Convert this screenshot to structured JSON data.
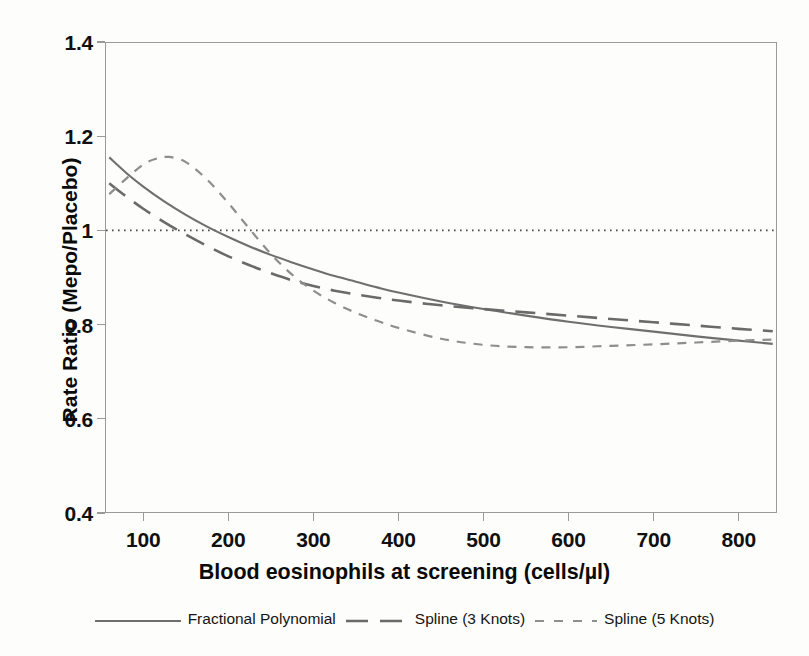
{
  "chart_data": {
    "type": "line",
    "title": "",
    "xlabel": "Blood eosinophils at screening (cells/µl)",
    "ylabel": "Rate Ratio (Mepo/Placebo)",
    "xlim": [
      55,
      845
    ],
    "ylim": [
      0.4,
      1.4
    ],
    "xticks": [
      100,
      200,
      300,
      400,
      500,
      600,
      700,
      800
    ],
    "xtick_labels": [
      "100",
      "200",
      "300",
      "400",
      "500",
      "600",
      "700",
      "800"
    ],
    "yticks": [
      1.4,
      1.2,
      1.0,
      0.8,
      0.6,
      0.4
    ],
    "ytick_labels": [
      "1.4",
      "1.2",
      "1",
      "0.8",
      "0.6",
      "0.4"
    ],
    "grid": false,
    "legend_position": "bottom",
    "reference_lines": [
      {
        "name": "null-effect",
        "axis": "y",
        "value": 1.0,
        "style": "dotted",
        "color": "#4a4a4a"
      }
    ],
    "series": [
      {
        "name": "Fractional Polynomial",
        "style": "solid",
        "color": "#6f6f6f",
        "x": [
          60,
          80,
          100,
          125,
          150,
          175,
          200,
          225,
          250,
          275,
          300,
          325,
          350,
          375,
          400,
          450,
          500,
          550,
          600,
          650,
          700,
          750,
          800,
          840
        ],
        "values": [
          1.155,
          1.122,
          1.093,
          1.061,
          1.033,
          1.008,
          0.986,
          0.966,
          0.948,
          0.932,
          0.917,
          0.903,
          0.891,
          0.879,
          0.868,
          0.849,
          0.833,
          0.819,
          0.806,
          0.795,
          0.785,
          0.775,
          0.766,
          0.759
        ]
      },
      {
        "name": "Spline (3 Knots)",
        "style": "long-dash",
        "color": "#6a6a6a",
        "x": [
          60,
          80,
          100,
          125,
          150,
          175,
          200,
          225,
          250,
          275,
          300,
          325,
          350,
          375,
          400,
          450,
          500,
          550,
          600,
          650,
          700,
          750,
          800,
          840
        ],
        "values": [
          1.1,
          1.072,
          1.046,
          1.017,
          0.991,
          0.967,
          0.945,
          0.926,
          0.909,
          0.894,
          0.882,
          0.872,
          0.864,
          0.857,
          0.851,
          0.841,
          0.833,
          0.826,
          0.819,
          0.812,
          0.805,
          0.798,
          0.791,
          0.786
        ]
      },
      {
        "name": "Spline (5 Knots)",
        "style": "short-dash",
        "color": "#8e8e8e",
        "x": [
          60,
          80,
          100,
          115,
          130,
          150,
          175,
          200,
          225,
          250,
          275,
          300,
          325,
          350,
          375,
          400,
          450,
          500,
          550,
          600,
          650,
          700,
          750,
          800,
          840
        ],
        "values": [
          1.077,
          1.11,
          1.14,
          1.152,
          1.156,
          1.145,
          1.108,
          1.058,
          1.003,
          0.95,
          0.906,
          0.872,
          0.846,
          0.825,
          0.808,
          0.793,
          0.77,
          0.757,
          0.752,
          0.752,
          0.755,
          0.758,
          0.762,
          0.766,
          0.768
        ]
      }
    ]
  },
  "legend": {
    "items": [
      {
        "label": "Fractional Polynomial",
        "style": "solid"
      },
      {
        "label": "Spline (3 Knots)",
        "style": "long-dash"
      },
      {
        "label": "Spline (5 Knots)",
        "style": "short-dash"
      }
    ]
  },
  "colors": {
    "frame": "#9a9a9a",
    "solid_line": "#6f6f6f",
    "long_dash_line": "#6a6a6a",
    "short_dash_line": "#8e8e8e",
    "reference_line": "#4a4a4a",
    "text": "#101010",
    "background": "#fdfdfb"
  }
}
